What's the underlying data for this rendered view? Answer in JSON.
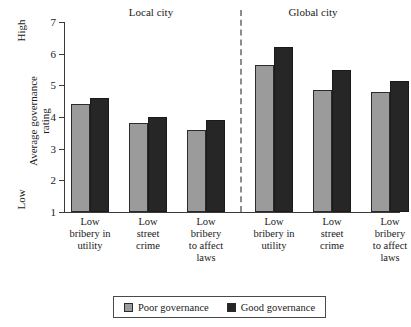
{
  "chart_data": {
    "type": "bar",
    "title": "",
    "xlabel": "",
    "ylabel": "Average governance\nrating",
    "ylim": [
      1,
      7
    ],
    "yticks": [
      1,
      2,
      3,
      4,
      5,
      6,
      7
    ],
    "ytick_labels": [
      "1",
      "2",
      "3",
      "4",
      "5",
      "6",
      "7"
    ],
    "y_axis_low_label": "Low",
    "y_axis_high_label": "High",
    "grid": false,
    "legend_position": "bottom",
    "panels": [
      "Local city",
      "Global city"
    ],
    "categories": [
      "Low\nbribery in\nutility",
      "Low\nstreet\ncrime",
      "Low\nbribery\nto affect\nlaws",
      "Low\nbribery in\nutility",
      "Low\nstreet\ncrime",
      "Low\nbribery\nto affect\nlaws"
    ],
    "series": [
      {
        "name": "Poor governance",
        "color": "#9b9b9b",
        "values": [
          4.4,
          3.8,
          3.6,
          5.65,
          4.85,
          4.8
        ]
      },
      {
        "name": "Good governance",
        "color": "#262626",
        "values": [
          4.6,
          4.0,
          3.9,
          6.2,
          5.5,
          5.15
        ]
      }
    ],
    "annotations": [
      "dashed vertical divider separating Local city and Global city panels"
    ]
  },
  "panel_titles": {
    "local": "Local city",
    "global": "Global city"
  },
  "y_axis": {
    "label": "Average governance\nrating",
    "high": "High",
    "low": "Low",
    "ticks": [
      "7",
      "6",
      "5",
      "4",
      "3",
      "2",
      "1"
    ]
  },
  "legend": {
    "items": [
      {
        "label": "Poor governance"
      },
      {
        "label": "Good governance"
      }
    ]
  }
}
